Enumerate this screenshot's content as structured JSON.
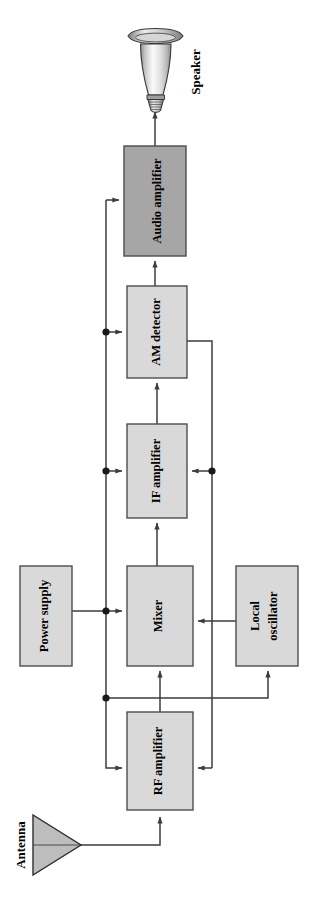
{
  "diagram": {
    "orientation": "rotated-90-clockwise",
    "colors": {
      "box_fill_light": "#d9d9d9",
      "box_fill_dark": "#a6a6a6",
      "box_stroke": "#4d4d4d",
      "line": "#3d3d3d",
      "antenna_fill": "#bdbdbd",
      "speaker_light": "#f2f2f2",
      "speaker_mid": "#c9c9c9",
      "speaker_dark": "#8f8f8f",
      "background": "#ffffff",
      "text": "#000000"
    },
    "blocks": [
      {
        "id": "audio_amplifier",
        "label": "Audio amplifier",
        "shade": "dark",
        "x": 124,
        "y": 146,
        "w": 62,
        "h": 110
      },
      {
        "id": "am_detector",
        "label": "AM detector",
        "shade": "light",
        "x": 127,
        "y": 286,
        "w": 60,
        "h": 92
      },
      {
        "id": "if_amplifier",
        "label": "IF amplifier",
        "shade": "light",
        "x": 127,
        "y": 424,
        "w": 60,
        "h": 94
      },
      {
        "id": "mixer",
        "label": "Mixer",
        "shade": "light",
        "x": 127,
        "y": 566,
        "w": 66,
        "h": 100
      },
      {
        "id": "power_supply",
        "label": "Power supply",
        "shade": "light",
        "x": 20,
        "y": 566,
        "w": 52,
        "h": 100
      },
      {
        "id": "local_oscillator",
        "label": "Local\noscillator",
        "shade": "light",
        "x": 236,
        "y": 566,
        "w": 62,
        "h": 100
      },
      {
        "id": "rf_amplifier",
        "label": "RF amplifier",
        "shade": "light",
        "x": 127,
        "y": 712,
        "w": 66,
        "h": 98
      }
    ],
    "components": [
      {
        "id": "antenna",
        "label": "Antenna",
        "type": "triangle",
        "x": 33,
        "y": 815,
        "w": 48,
        "h": 60
      },
      {
        "id": "speaker",
        "label": "Speaker",
        "type": "horn-speaker",
        "x": 126,
        "y": 28,
        "w": 58,
        "h": 80
      }
    ],
    "junctions": [
      {
        "id": "j-audio-power",
        "x": 106,
        "y": 332
      },
      {
        "id": "j-if-power",
        "x": 106,
        "y": 471
      },
      {
        "id": "j-mixer-power",
        "x": 106,
        "y": 611
      },
      {
        "id": "j-low-power",
        "x": 106,
        "y": 698
      },
      {
        "id": "j-agc-if",
        "x": 212,
        "y": 471
      }
    ],
    "connections": [
      {
        "from": "antenna",
        "to": "rf_amplifier",
        "kind": "signal"
      },
      {
        "from": "rf_amplifier",
        "to": "mixer",
        "kind": "signal"
      },
      {
        "from": "local_oscillator",
        "to": "mixer",
        "kind": "signal"
      },
      {
        "from": "mixer",
        "to": "if_amplifier",
        "kind": "signal"
      },
      {
        "from": "if_amplifier",
        "to": "am_detector",
        "kind": "signal"
      },
      {
        "from": "am_detector",
        "to": "audio_amplifier",
        "kind": "signal"
      },
      {
        "from": "audio_amplifier",
        "to": "speaker",
        "kind": "signal"
      },
      {
        "from": "am_detector",
        "to": "if_amplifier",
        "kind": "agc-feedback"
      },
      {
        "from": "am_detector",
        "to": "rf_amplifier",
        "kind": "agc-feedback"
      },
      {
        "from": "power_supply",
        "to": "mixer",
        "kind": "power"
      },
      {
        "from": "power_supply",
        "to": "if_amplifier",
        "kind": "power"
      },
      {
        "from": "power_supply",
        "to": "am_detector",
        "kind": "power"
      },
      {
        "from": "power_supply",
        "to": "audio_amplifier",
        "kind": "power"
      },
      {
        "from": "power_supply",
        "to": "local_oscillator",
        "kind": "power"
      },
      {
        "from": "power_supply",
        "to": "rf_amplifier",
        "kind": "power"
      }
    ]
  }
}
